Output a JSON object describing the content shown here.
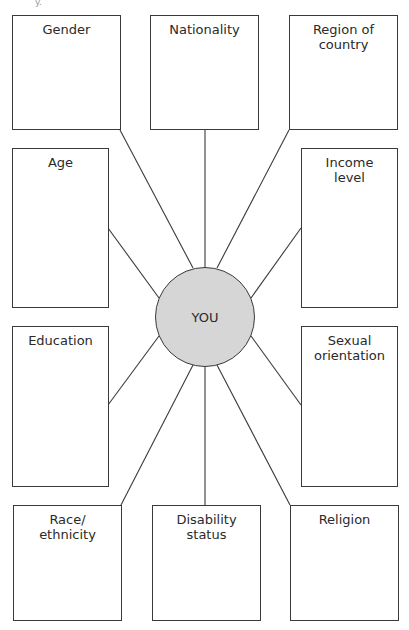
{
  "diagram": {
    "center": {
      "label": "YOU",
      "fill": "#d6d6d6"
    },
    "boxes": [
      {
        "id": "gender",
        "label": "Gender"
      },
      {
        "id": "nationality",
        "label": "Nationality"
      },
      {
        "id": "region",
        "label": "Region of\ncountry"
      },
      {
        "id": "age",
        "label": "Age"
      },
      {
        "id": "income",
        "label": "Income\nlevel"
      },
      {
        "id": "education",
        "label": "Education"
      },
      {
        "id": "sexual-orientation",
        "label": "Sexual\norientation"
      },
      {
        "id": "race",
        "label": "Race/\nethnicity"
      },
      {
        "id": "disability",
        "label": "Disability\nstatus"
      },
      {
        "id": "religion",
        "label": "Religion"
      }
    ],
    "corner_text": "y."
  }
}
